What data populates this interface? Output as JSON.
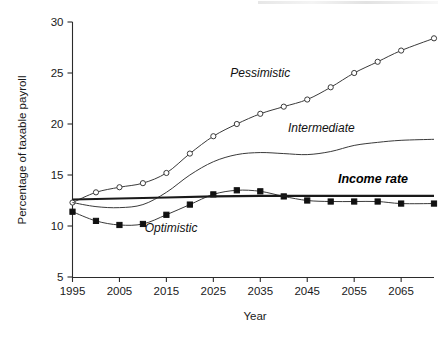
{
  "chart_data": {
    "type": "line",
    "title": "",
    "xlabel": "Year",
    "ylabel": "Percentage of taxable payroll",
    "xlim": [
      1995,
      2072
    ],
    "ylim": [
      5,
      30
    ],
    "xticks": [
      1995,
      2005,
      2015,
      2025,
      2035,
      2045,
      2055,
      2065
    ],
    "xtick_labels": [
      "1995",
      "2005",
      "2015",
      "2025",
      "2035",
      "2045",
      "2055",
      "2065"
    ],
    "yticks": [
      5,
      10,
      15,
      20,
      25,
      30
    ],
    "ytick_labels": [
      "5",
      "10",
      "15",
      "20",
      "25",
      "30"
    ],
    "grid": false,
    "legend_position": "inline-annotations",
    "series": [
      {
        "name": "Pessimistic",
        "marker": "open-circle",
        "line_style": "thin",
        "x": [
          1995,
          2000,
          2005,
          2010,
          2015,
          2020,
          2025,
          2030,
          2035,
          2040,
          2045,
          2050,
          2055,
          2060,
          2065,
          2072
        ],
        "values": [
          12.3,
          13.3,
          13.8,
          14.2,
          15.2,
          17.1,
          18.8,
          20.0,
          21.0,
          21.7,
          22.4,
          23.6,
          25.0,
          26.1,
          27.2,
          28.4
        ]
      },
      {
        "name": "Intermediate",
        "marker": "none",
        "line_style": "thin",
        "x": [
          1995,
          2000,
          2005,
          2010,
          2015,
          2020,
          2025,
          2030,
          2035,
          2040,
          2045,
          2050,
          2055,
          2060,
          2065,
          2072
        ],
        "values": [
          12.3,
          11.9,
          11.8,
          12.1,
          13.3,
          15.0,
          16.3,
          17.0,
          17.2,
          17.1,
          17.0,
          17.3,
          17.9,
          18.2,
          18.4,
          18.5
        ]
      },
      {
        "name": "Optimistic",
        "marker": "filled-square",
        "line_style": "thin",
        "x": [
          1995,
          2000,
          2005,
          2010,
          2015,
          2020,
          2025,
          2030,
          2035,
          2040,
          2045,
          2050,
          2055,
          2060,
          2065,
          2072
        ],
        "values": [
          11.4,
          10.5,
          10.1,
          10.2,
          11.1,
          12.1,
          13.1,
          13.5,
          13.4,
          12.9,
          12.5,
          12.4,
          12.4,
          12.4,
          12.2,
          12.2
        ]
      },
      {
        "name": "Income rate",
        "marker": "none",
        "line_style": "thick",
        "x": [
          1995,
          2005,
          2015,
          2025,
          2035,
          2045,
          2055,
          2065,
          2072
        ],
        "values": [
          12.6,
          12.7,
          12.8,
          12.9,
          12.95,
          12.95,
          12.95,
          12.95,
          12.95
        ]
      }
    ],
    "annotations": [
      {
        "text": "Pessimistic",
        "x": 2035,
        "y": 24.6,
        "style": "italic"
      },
      {
        "text": "Intermediate",
        "x": 2048,
        "y": 19.2,
        "style": "italic"
      },
      {
        "text": "Income rate",
        "x": 2059,
        "y": 14.2,
        "style": "bold-italic"
      },
      {
        "text": "Optimistic",
        "x": 2016,
        "y": 9.4,
        "style": "italic"
      }
    ]
  }
}
